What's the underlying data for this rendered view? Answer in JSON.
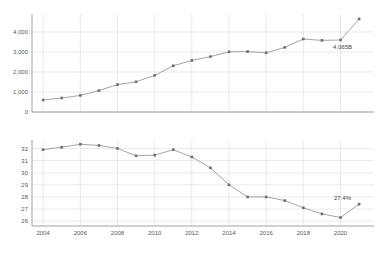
{
  "chart_data": [
    {
      "type": "line",
      "id": "top",
      "title": "",
      "xlabel": "",
      "ylabel": "",
      "grid": true,
      "legend": "none",
      "x": [
        2004,
        2005,
        2006,
        2007,
        2008,
        2009,
        2010,
        2011,
        2012,
        2013,
        2014,
        2015,
        2016,
        2017,
        2018,
        2019,
        2020,
        2021
      ],
      "xlim": [
        2003.4,
        2021.8
      ],
      "ylim": [
        0,
        4900
      ],
      "yticks": [
        0,
        1000,
        2000,
        3000,
        4000
      ],
      "ytick_labels": [
        "0",
        "1,000",
        "2,000",
        "3,000",
        "4,000"
      ],
      "xticks": [
        2004,
        2006,
        2008,
        2010,
        2012,
        2014,
        2016,
        2018,
        2020
      ],
      "xtick_labels": [
        "2004",
        "2006",
        "2008",
        "2010",
        "2012",
        "2014",
        "2016",
        "2018",
        "2020"
      ],
      "values": [
        600,
        700,
        830,
        1070,
        1370,
        1510,
        1830,
        2310,
        2580,
        2770,
        3010,
        3020,
        2960,
        3230,
        3650,
        3580,
        3600,
        4650
      ],
      "annotations": [
        {
          "text": "4,065B",
          "x": 2020,
          "y": 3600
        }
      ]
    },
    {
      "type": "line",
      "id": "bottom",
      "title": "",
      "xlabel": "",
      "ylabel": "",
      "grid": true,
      "legend": "none",
      "x": [
        2004,
        2005,
        2006,
        2007,
        2008,
        2009,
        2010,
        2011,
        2012,
        2013,
        2014,
        2015,
        2016,
        2017,
        2018,
        2019,
        2020,
        2021
      ],
      "xlim": [
        2003.4,
        2021.8
      ],
      "ylim": [
        25.6,
        32.7
      ],
      "yticks": [
        26,
        27,
        28,
        29,
        30,
        31,
        32
      ],
      "ytick_labels": [
        "26",
        "27",
        "28",
        "29",
        "30",
        "31",
        "32"
      ],
      "xticks": [
        2004,
        2006,
        2008,
        2010,
        2012,
        2014,
        2016,
        2018,
        2020
      ],
      "xtick_labels": [
        "2004",
        "2006",
        "2008",
        "2010",
        "2012",
        "2014",
        "2016",
        "2018",
        "2020"
      ],
      "values": [
        31.9,
        32.1,
        32.35,
        32.25,
        32.0,
        31.4,
        31.45,
        31.9,
        31.3,
        30.4,
        29.0,
        28.0,
        28.0,
        27.7,
        27.1,
        26.6,
        26.3,
        27.4
      ],
      "annotations": [
        {
          "text": "27.4%",
          "x": 2020,
          "y": 27.4
        }
      ]
    }
  ],
  "colors": {
    "line": "#9a9a9a",
    "marker": "#6e6e6e",
    "grid": "#dcdcdc",
    "axis": "#8c8c8c",
    "tick_text": "#595959",
    "label_text": "#3f3f3f",
    "background": "#ffffff"
  }
}
